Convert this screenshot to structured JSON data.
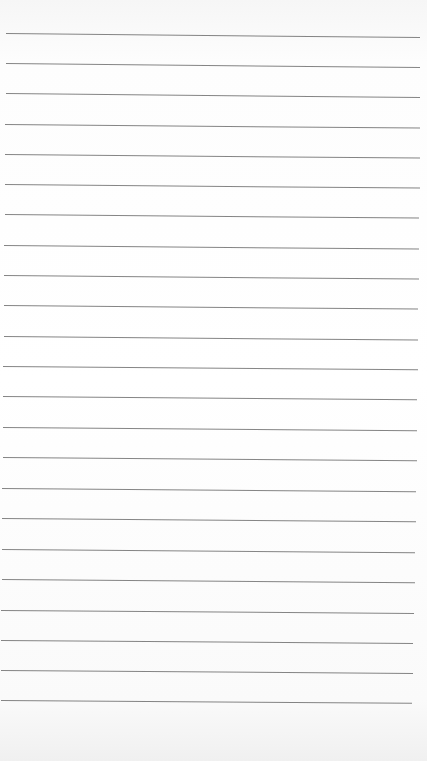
{
  "paper": {
    "type": "ruled-lined-paper",
    "background_color": "#ffffff",
    "line_color": "#6e6e6e",
    "line_count": 23,
    "lines": [
      {
        "y": 33,
        "x1": 6,
        "x2": 420,
        "tilt": 0.55
      },
      {
        "y": 63,
        "x1": 6,
        "x2": 420,
        "tilt": 0.55
      },
      {
        "y": 93,
        "x1": 6,
        "x2": 420,
        "tilt": 0.55
      },
      {
        "y": 124,
        "x1": 5,
        "x2": 420,
        "tilt": 0.5
      },
      {
        "y": 154,
        "x1": 5,
        "x2": 420,
        "tilt": 0.5
      },
      {
        "y": 184,
        "x1": 5,
        "x2": 420,
        "tilt": 0.5
      },
      {
        "y": 214,
        "x1": 5,
        "x2": 419,
        "tilt": 0.5
      },
      {
        "y": 245,
        "x1": 4,
        "x2": 419,
        "tilt": 0.5
      },
      {
        "y": 275,
        "x1": 4,
        "x2": 419,
        "tilt": 0.5
      },
      {
        "y": 305,
        "x1": 4,
        "x2": 418,
        "tilt": 0.5
      },
      {
        "y": 336,
        "x1": 4,
        "x2": 418,
        "tilt": 0.5
      },
      {
        "y": 366,
        "x1": 3,
        "x2": 418,
        "tilt": 0.45
      },
      {
        "y": 396,
        "x1": 3,
        "x2": 417,
        "tilt": 0.45
      },
      {
        "y": 427,
        "x1": 3,
        "x2": 417,
        "tilt": 0.45
      },
      {
        "y": 457,
        "x1": 3,
        "x2": 417,
        "tilt": 0.45
      },
      {
        "y": 488,
        "x1": 2,
        "x2": 416,
        "tilt": 0.45
      },
      {
        "y": 518,
        "x1": 2,
        "x2": 416,
        "tilt": 0.45
      },
      {
        "y": 549,
        "x1": 2,
        "x2": 415,
        "tilt": 0.45
      },
      {
        "y": 579,
        "x1": 2,
        "x2": 415,
        "tilt": 0.45
      },
      {
        "y": 610,
        "x1": 1,
        "x2": 414,
        "tilt": 0.4
      },
      {
        "y": 640,
        "x1": 1,
        "x2": 413,
        "tilt": 0.4
      },
      {
        "y": 670,
        "x1": 1,
        "x2": 413,
        "tilt": 0.4
      },
      {
        "y": 700,
        "x1": 1,
        "x2": 412,
        "tilt": 0.4
      }
    ]
  }
}
